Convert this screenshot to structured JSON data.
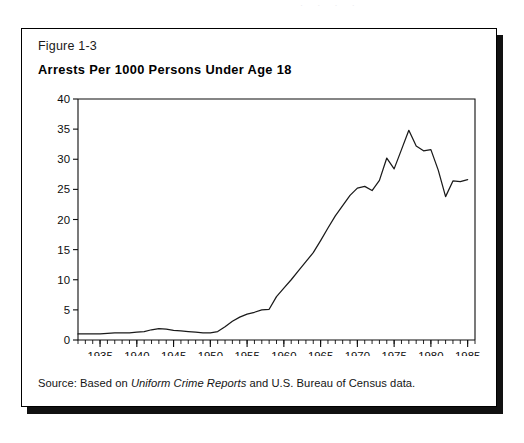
{
  "page_bleed": "· · · ·",
  "figure": {
    "label": "Figure 1-3",
    "title": "Arrests Per 1000 Persons Under Age 18",
    "source_prefix": "Source: Based on ",
    "source_italic": "Uniform Crime Reports",
    "source_suffix": " and U.S. Bureau of Census data."
  },
  "chart_data": {
    "type": "line",
    "title": "Arrests Per 1000 Persons Under Age 18",
    "xlabel": "",
    "ylabel": "",
    "xlim": [
      1932,
      1986
    ],
    "ylim": [
      0,
      40
    ],
    "grid": false,
    "legend": null,
    "line_color": "#1a1a1a",
    "ytick_labels": [
      "0",
      "5",
      "10",
      "15",
      "20",
      "25",
      "30",
      "35",
      "40"
    ],
    "yticks": [
      0,
      5,
      10,
      15,
      20,
      25,
      30,
      35,
      40
    ],
    "xtick_labels": [
      "1935",
      "1940",
      "1945",
      "1950",
      "1955",
      "1960",
      "1965",
      "1970",
      "1975",
      "1980",
      "1985"
    ],
    "xticks": [
      1935,
      1940,
      1945,
      1950,
      1955,
      1960,
      1965,
      1970,
      1975,
      1980,
      1985
    ],
    "x_minor_tick_step": 1,
    "x": [
      1932,
      1933,
      1934,
      1935,
      1936,
      1937,
      1938,
      1939,
      1940,
      1941,
      1942,
      1943,
      1944,
      1945,
      1946,
      1947,
      1948,
      1949,
      1950,
      1951,
      1952,
      1953,
      1954,
      1955,
      1956,
      1957,
      1958,
      1959,
      1960,
      1961,
      1962,
      1963,
      1964,
      1965,
      1966,
      1967,
      1968,
      1969,
      1970,
      1971,
      1972,
      1973,
      1974,
      1975,
      1976,
      1977,
      1978,
      1979,
      1980,
      1981,
      1982,
      1983,
      1984,
      1985
    ],
    "values": [
      1.0,
      1.0,
      1.0,
      1.0,
      1.1,
      1.2,
      1.2,
      1.2,
      1.3,
      1.4,
      1.7,
      1.9,
      1.8,
      1.6,
      1.5,
      1.4,
      1.3,
      1.2,
      1.2,
      1.4,
      2.2,
      3.1,
      3.8,
      4.3,
      4.6,
      5.0,
      5.1,
      7.2,
      8.6,
      10.0,
      11.5,
      13.0,
      14.5,
      16.5,
      18.6,
      20.6,
      22.3,
      24.0,
      25.2,
      25.5,
      24.8,
      26.5,
      30.2,
      28.4,
      31.6,
      34.8,
      32.2,
      31.4,
      31.6,
      28.2,
      23.8,
      26.4,
      26.3,
      26.6
    ],
    "peak": {
      "year": 1977,
      "value": 34.8
    },
    "trough_after_peak": {
      "year": 1982,
      "value": 23.8
    },
    "end_value": {
      "year": 1985,
      "value": 26.6
    }
  }
}
